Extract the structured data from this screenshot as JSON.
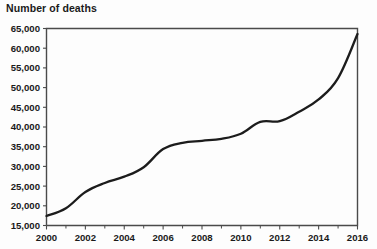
{
  "chart_data": {
    "type": "line",
    "title": "Number of deaths",
    "xlabel": "",
    "ylabel": "",
    "grid": false,
    "legend": "none",
    "xlim": [
      2000,
      2016
    ],
    "ylim": [
      15000,
      65000
    ],
    "x": [
      2000,
      2001,
      2002,
      2003,
      2004,
      2005,
      2006,
      2007,
      2008,
      2009,
      2010,
      2011,
      2012,
      2013,
      2014,
      2015,
      2016
    ],
    "series": [
      {
        "name": "Number of deaths",
        "color": "#1c1c1c",
        "values": [
          17400,
          19400,
          23500,
          25800,
          27400,
          29800,
          34400,
          36000,
          36500,
          37000,
          38300,
          41300,
          41500,
          43900,
          47000,
          52400,
          63600
        ]
      }
    ],
    "y_ticks": [
      15000,
      20000,
      25000,
      30000,
      35000,
      40000,
      45000,
      50000,
      55000,
      60000,
      65000
    ],
    "y_tick_labels": [
      "15,000",
      "20,000",
      "25,000",
      "30,000",
      "35,000",
      "40,000",
      "45,000",
      "50,000",
      "55,000",
      "60,000",
      "65,000"
    ],
    "x_ticks": [
      2000,
      2001,
      2002,
      2003,
      2004,
      2005,
      2006,
      2007,
      2008,
      2009,
      2010,
      2011,
      2012,
      2013,
      2014,
      2015,
      2016
    ],
    "x_tick_labels": [
      "2000",
      "",
      "2002",
      "",
      "2004",
      "",
      "2006",
      "",
      "2008",
      "",
      "2010",
      "",
      "2012",
      "",
      "2014",
      "",
      "2016"
    ],
    "x_labeled_ticks": [
      {
        "value": 2000,
        "label": "2000"
      },
      {
        "value": 2002,
        "label": "2002"
      },
      {
        "value": 2004,
        "label": "2004"
      },
      {
        "value": 2006,
        "label": "2006"
      },
      {
        "value": 2008,
        "label": "2008"
      },
      {
        "value": 2010,
        "label": "2010"
      },
      {
        "value": 2012,
        "label": "2012"
      },
      {
        "value": 2014,
        "label": "2014"
      },
      {
        "value": 2016,
        "label": "2016"
      }
    ],
    "axis_color": "#4a4a4a",
    "background_color": "#fdfdfd"
  }
}
